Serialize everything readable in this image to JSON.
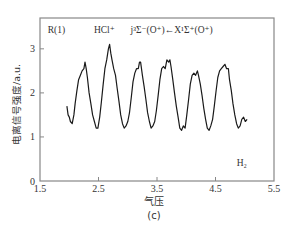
{
  "chart_data": {
    "type": "line",
    "title": "",
    "xlabel": "气压",
    "ylabel": "电离信号强度/a.u.",
    "caption": "(c)",
    "xlim": [
      1.5,
      5.5
    ],
    "ylim": [
      0,
      3.7
    ],
    "xticks": [
      1.5,
      2.5,
      3.5,
      4.5,
      5.5
    ],
    "xtick_labels": [
      "1.5",
      "2.5",
      "3.5",
      "4.5",
      "5.5"
    ],
    "yticks": [
      0,
      1,
      2,
      3
    ],
    "ytick_labels": [
      "0",
      "1",
      "2",
      "3"
    ],
    "grid": false,
    "annotations": [
      {
        "text": "R(1)",
        "x": 1.78,
        "y": 3.35
      },
      {
        "text": "HCl⁺",
        "x": 2.6,
        "y": 3.35
      },
      {
        "text": "j³Σ⁻(O⁺)←X¹Σ⁺(O⁺)",
        "x": 3.75,
        "y": 3.35
      },
      {
        "text": "H₂",
        "x": 4.95,
        "y": 0.35
      }
    ],
    "series": [
      {
        "name": "ionization signal",
        "x": [
          1.96,
          1.98,
          2.0,
          2.02,
          2.05,
          2.08,
          2.1,
          2.13,
          2.16,
          2.19,
          2.22,
          2.25,
          2.27,
          2.29,
          2.31,
          2.34,
          2.37,
          2.4,
          2.43,
          2.46,
          2.49,
          2.52,
          2.55,
          2.58,
          2.61,
          2.64,
          2.67,
          2.69,
          2.71,
          2.73,
          2.76,
          2.79,
          2.82,
          2.85,
          2.88,
          2.91,
          2.94,
          2.97,
          3.0,
          3.03,
          3.06,
          3.09,
          3.12,
          3.15,
          3.18,
          3.2,
          3.22,
          3.25,
          3.28,
          3.31,
          3.34,
          3.37,
          3.4,
          3.43,
          3.46,
          3.49,
          3.52,
          3.55,
          3.58,
          3.61,
          3.64,
          3.67,
          3.7,
          3.72,
          3.74,
          3.77,
          3.8,
          3.83,
          3.86,
          3.89,
          3.92,
          3.95,
          3.98,
          4.01,
          4.04,
          4.07,
          4.1,
          4.13,
          4.16,
          4.19,
          4.21,
          4.24,
          4.27,
          4.3,
          4.33,
          4.36,
          4.39,
          4.42,
          4.45,
          4.48,
          4.51,
          4.54,
          4.57,
          4.6,
          4.63,
          4.66,
          4.69,
          4.72,
          4.74,
          4.77,
          4.8,
          4.83,
          4.86,
          4.89,
          4.92,
          4.95,
          4.98,
          5.01,
          5.04
        ],
        "y": [
          1.7,
          1.5,
          1.45,
          1.35,
          1.3,
          1.5,
          1.75,
          2.05,
          2.3,
          2.4,
          2.5,
          2.55,
          2.7,
          2.55,
          2.35,
          2.0,
          1.75,
          1.5,
          1.35,
          1.2,
          1.2,
          1.45,
          1.8,
          2.2,
          2.55,
          2.75,
          3.0,
          3.1,
          2.9,
          2.75,
          2.55,
          2.4,
          2.1,
          1.8,
          1.5,
          1.3,
          1.2,
          1.25,
          1.35,
          1.55,
          1.9,
          2.25,
          2.45,
          2.55,
          2.55,
          2.7,
          2.7,
          2.4,
          2.15,
          1.85,
          1.55,
          1.35,
          1.2,
          1.25,
          1.35,
          1.6,
          1.95,
          2.3,
          2.55,
          2.6,
          2.55,
          2.75,
          2.7,
          2.75,
          2.6,
          2.3,
          2.0,
          1.7,
          1.45,
          1.2,
          1.15,
          1.25,
          1.2,
          1.5,
          1.85,
          2.2,
          2.4,
          2.45,
          2.4,
          2.5,
          2.4,
          2.2,
          1.95,
          1.65,
          1.4,
          1.2,
          1.15,
          1.25,
          1.4,
          1.7,
          2.05,
          2.35,
          2.5,
          2.55,
          2.6,
          2.65,
          2.55,
          2.55,
          2.3,
          2.05,
          1.75,
          1.5,
          1.3,
          1.2,
          1.25,
          1.4,
          1.45,
          1.35,
          1.4
        ]
      }
    ]
  },
  "colors": {
    "axis": "#888888",
    "line": "#1a1a1a",
    "text": "#333333",
    "background": "#ffffff"
  }
}
